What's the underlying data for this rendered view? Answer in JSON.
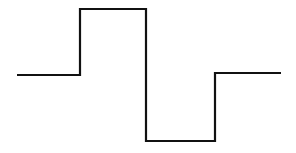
{
  "diagram": {
    "type": "square-wave-pulse",
    "background": "#ffffff",
    "stroke_color": "#111111",
    "stroke_width": 2.2,
    "points": [
      [
        17,
        75
      ],
      [
        80,
        75
      ],
      [
        80,
        9
      ],
      [
        146,
        9
      ],
      [
        146,
        141
      ],
      [
        215,
        141
      ],
      [
        215,
        73
      ],
      [
        281,
        73
      ]
    ],
    "segments": [
      {
        "name": "baseline-left",
        "from": [
          17,
          75
        ],
        "to": [
          80,
          75
        ]
      },
      {
        "name": "rising-edge",
        "from": [
          80,
          75
        ],
        "to": [
          80,
          9
        ]
      },
      {
        "name": "high-level",
        "from": [
          80,
          9
        ],
        "to": [
          146,
          9
        ]
      },
      {
        "name": "falling-edge",
        "from": [
          146,
          9
        ],
        "to": [
          146,
          141
        ]
      },
      {
        "name": "low-level",
        "from": [
          146,
          141
        ],
        "to": [
          215,
          141
        ]
      },
      {
        "name": "rising-edge-return",
        "from": [
          215,
          141
        ],
        "to": [
          215,
          73
        ]
      },
      {
        "name": "baseline-right",
        "from": [
          215,
          73
        ],
        "to": [
          281,
          73
        ]
      }
    ]
  }
}
